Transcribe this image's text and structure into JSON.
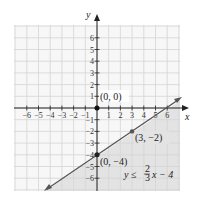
{
  "chart_data": {
    "type": "line",
    "title": "",
    "xlabel": "x",
    "ylabel": "y",
    "xlim": [
      -7,
      7
    ],
    "ylim": [
      -7,
      7
    ],
    "grid": true,
    "x_ticks": [
      "-6",
      "-5",
      "-4",
      "-3",
      "-2",
      "-1",
      "1",
      "2",
      "3",
      "4",
      "5",
      "6"
    ],
    "y_ticks": [
      "6",
      "5",
      "4",
      "3",
      "2",
      "1",
      "-1",
      "-2",
      "-3",
      "-4",
      "-5",
      "-6"
    ],
    "series": [
      {
        "name": "y = (2/3)x - 4",
        "type": "line",
        "x": [
          -4.5,
          6.5
        ],
        "y": [
          -7,
          0.333
        ],
        "color": "#555555"
      }
    ],
    "shaded_region": {
      "description": "below the boundary line",
      "inequality": "y ≤ (2/3)x − 4",
      "color": "#e6e6e6"
    },
    "points": [
      {
        "x": 0,
        "y": 0,
        "label": "(0, 0)"
      },
      {
        "x": 3,
        "y": -2,
        "label": "(3, −2)"
      },
      {
        "x": 0,
        "y": -4,
        "label": "(0, −4)"
      }
    ],
    "annotations": [
      {
        "text": "y ≤ 2/3 x − 4",
        "position": "lower-right"
      }
    ]
  },
  "labels": {
    "x_axis": "x",
    "y_axis": "y",
    "p_origin": "(0, 0)",
    "p_32": "(3, −2)",
    "p_04": "(0, −4)",
    "eq_lhs": "y ≤",
    "eq_num": "2",
    "eq_den": "3",
    "eq_rhs": "x − 4"
  }
}
